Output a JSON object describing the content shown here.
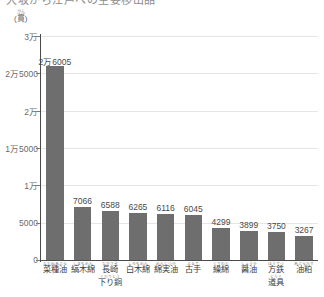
{
  "title": "大坂から江戸への主要移出品",
  "axis": {
    "unit_furigana": "かん",
    "unit_label": "(貫)",
    "y_ticks": [
      "3万",
      "2万5000",
      "2万",
      "1万5000",
      "1万",
      "5000",
      "0"
    ],
    "y_tick_values": [
      30000,
      25000,
      20000,
      15000,
      10000,
      5000,
      0
    ]
  },
  "chart_data": {
    "type": "bar",
    "title": "大坂から江戸への主要移出品",
    "xlabel": "",
    "ylabel": "(貫)",
    "ylim": [
      0,
      30000
    ],
    "grid": true,
    "legend": "none",
    "bar_color": "#6e6e6e",
    "categories": [
      "菜種油",
      "縞木綿",
      "長崎下り銅",
      "白木綿",
      "綿実油",
      "古手",
      "繰綿",
      "醤油",
      "方鉄道具",
      "油粕"
    ],
    "category_furigana": [
      "なたねあぶら",
      "しまもめん",
      "ながさきくだりどう",
      "しろもめん",
      "めんじつゆ",
      "ふるて",
      "くりわた",
      "しょうゆ",
      "ほうてつどうぐ",
      "あぶらかす"
    ],
    "values": [
      26005,
      7066,
      6588,
      6265,
      6116,
      6045,
      4299,
      3899,
      3750,
      3267
    ],
    "value_labels": [
      "2万6005",
      "7066",
      "6588",
      "6265",
      "6116",
      "6045",
      "4299",
      "3899",
      "3750",
      "3267"
    ]
  }
}
